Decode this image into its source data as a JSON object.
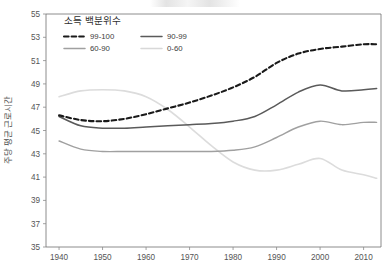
{
  "chart_data": {
    "type": "line",
    "title": "",
    "xlabel": "",
    "ylabel": "주당 평균 근로시간",
    "xlim": [
      1937,
      2014
    ],
    "ylim": [
      35,
      55
    ],
    "xticks": [
      1940,
      1950,
      1960,
      1970,
      1980,
      1990,
      2000,
      2010
    ],
    "yticks": [
      35,
      37,
      39,
      41,
      43,
      45,
      47,
      49,
      51,
      53,
      55
    ],
    "grid": false,
    "legend": {
      "title": "소득 백분위수",
      "position": "top-left-inside",
      "entries": [
        {
          "label": "99-100",
          "style": "dashed",
          "color": "#1a1a1a"
        },
        {
          "label": "90-99",
          "style": "solid",
          "color": "#5a5a5a"
        },
        {
          "label": "60-90",
          "style": "solid",
          "color": "#a0a0a0"
        },
        {
          "label": "0-60",
          "style": "solid",
          "color": "#d8d8d8"
        }
      ]
    },
    "x": [
      1940,
      1945,
      1950,
      1955,
      1960,
      1965,
      1970,
      1975,
      1980,
      1985,
      1990,
      1995,
      2000,
      2005,
      2010,
      2013
    ],
    "series": [
      {
        "name": "99-100",
        "color": "#1a1a1a",
        "style": "dashed",
        "width": 2.1,
        "values": [
          46.3,
          45.9,
          45.8,
          46.0,
          46.4,
          46.9,
          47.4,
          48.0,
          48.7,
          49.6,
          50.8,
          51.6,
          52.0,
          52.2,
          52.4,
          52.4
        ]
      },
      {
        "name": "90-99",
        "color": "#5a5a5a",
        "style": "solid",
        "width": 1.5,
        "values": [
          46.2,
          45.4,
          45.2,
          45.2,
          45.3,
          45.4,
          45.5,
          45.6,
          45.8,
          46.2,
          47.2,
          48.3,
          48.9,
          48.4,
          48.5,
          48.6
        ]
      },
      {
        "name": "60-90",
        "color": "#a0a0a0",
        "style": "solid",
        "width": 1.4,
        "values": [
          44.1,
          43.4,
          43.2,
          43.2,
          43.2,
          43.2,
          43.2,
          43.2,
          43.3,
          43.6,
          44.4,
          45.3,
          45.8,
          45.5,
          45.7,
          45.7
        ]
      },
      {
        "name": "0-60",
        "color": "#dcdcdc",
        "style": "solid",
        "width": 1.6,
        "values": [
          47.9,
          48.4,
          48.5,
          48.4,
          47.9,
          46.8,
          45.3,
          43.7,
          42.3,
          41.6,
          41.6,
          42.1,
          42.6,
          41.6,
          41.2,
          40.9
        ]
      }
    ]
  },
  "axis": {
    "y_title": "주당 평균 근로시간",
    "y_tick_labels": [
      "55",
      "53",
      "51",
      "49",
      "47",
      "45",
      "43",
      "41",
      "39",
      "37",
      "35"
    ],
    "x_tick_labels": [
      "1940",
      "1950",
      "1960",
      "1970",
      "1980",
      "1990",
      "2000",
      "2010"
    ]
  }
}
